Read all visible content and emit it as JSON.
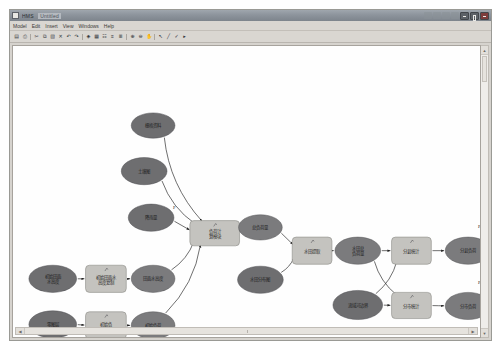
{
  "window": {
    "title": "HMS",
    "title_secondary": "Untitled",
    "controls": [
      "minimize",
      "maximize",
      "close"
    ]
  },
  "menubar": {
    "items": [
      {
        "label": "Model"
      },
      {
        "label": "Edit"
      },
      {
        "label": "Insert"
      },
      {
        "label": "View"
      },
      {
        "label": "Windows"
      },
      {
        "label": "Help"
      }
    ]
  },
  "toolbar": {
    "buttons": [
      {
        "name": "save-icon",
        "glyph": "▤"
      },
      {
        "name": "print-icon",
        "glyph": "⎙"
      },
      {
        "name": "cut-icon",
        "glyph": "✂"
      },
      {
        "name": "copy-icon",
        "glyph": "⧉"
      },
      {
        "name": "paste-icon",
        "glyph": "▧"
      },
      {
        "name": "delete-icon",
        "glyph": "✕"
      },
      {
        "name": "undo-icon",
        "glyph": "↶"
      },
      {
        "name": "redo-icon",
        "glyph": "↷"
      },
      {
        "name": "run-icon",
        "glyph": "◈"
      },
      {
        "name": "grid-icon",
        "glyph": "▦"
      },
      {
        "name": "layers-icon",
        "glyph": "☷"
      },
      {
        "name": "align-left-icon",
        "glyph": "≡"
      },
      {
        "name": "align-right-icon",
        "glyph": "≣"
      },
      {
        "name": "zoom-in-icon",
        "glyph": "⊕"
      },
      {
        "name": "zoom-out-icon",
        "glyph": "⊖"
      },
      {
        "name": "pan-icon",
        "glyph": "✋"
      },
      {
        "name": "pointer-icon",
        "glyph": "↖"
      },
      {
        "name": "connector-icon",
        "glyph": "╱"
      },
      {
        "name": "link-icon",
        "glyph": "✓"
      },
      {
        "name": "more-icon",
        "glyph": "▸"
      }
    ]
  },
  "scrollbars": {
    "vertical_up": "▲",
    "vertical_down": "▼",
    "horizontal_left": "◀",
    "horizontal_right": "▶"
  },
  "diagram": {
    "nodes": [
      {
        "id": "n1",
        "label": "栅格资料",
        "shape": "ellipse",
        "tone": "dark",
        "cx": 141,
        "cy": 82,
        "rx": 22,
        "ry": 13
      },
      {
        "id": "n2",
        "label": "土壤图",
        "shape": "ellipse",
        "tone": "dark",
        "cx": 132,
        "cy": 129,
        "rx": 23,
        "ry": 14
      },
      {
        "id": "n3",
        "label": "降雨量",
        "shape": "ellipse",
        "tone": "dark",
        "cx": 139,
        "cy": 177,
        "rx": 23,
        "ry": 14
      },
      {
        "id": "n4",
        "label": "负荷计算模块",
        "shape": "process",
        "x": 178,
        "y": 180,
        "w": 50,
        "h": 26
      },
      {
        "id": "n5",
        "label": "总负荷量",
        "shape": "ellipse",
        "tone": "mid",
        "cx": 249,
        "cy": 187,
        "rx": 22,
        "ry": 13
      },
      {
        "id": "n6",
        "label": "水田分布图",
        "shape": "ellipse",
        "tone": "dark",
        "cx": 249,
        "cy": 241,
        "rx": 23,
        "ry": 14
      },
      {
        "id": "n7",
        "label": "初始田面水高度",
        "shape": "ellipse",
        "tone": "dark",
        "cx": 40,
        "cy": 240,
        "rx": 24,
        "ry": 14
      },
      {
        "id": "n8",
        "label": "初始田面水高度复制",
        "shape": "process",
        "x": 73,
        "y": 226,
        "w": 41,
        "h": 28
      },
      {
        "id": "n9",
        "label": "田面水高度",
        "shape": "ellipse",
        "tone": "mid",
        "cx": 141,
        "cy": 240,
        "rx": 22,
        "ry": 14
      },
      {
        "id": "n10",
        "label": "零图层",
        "shape": "ellipse",
        "tone": "dark",
        "cx": 40,
        "cy": 287,
        "rx": 24,
        "ry": 14
      },
      {
        "id": "n11",
        "label": "初始负荷复制",
        "shape": "process",
        "x": 73,
        "y": 274,
        "w": 41,
        "h": 28
      },
      {
        "id": "n12",
        "label": "初始负荷",
        "shape": "ellipse",
        "tone": "mid",
        "cx": 141,
        "cy": 288,
        "rx": 22,
        "ry": 14
      },
      {
        "id": "n13",
        "label": "水田提取",
        "shape": "process",
        "x": 281,
        "y": 197,
        "w": 40,
        "h": 28
      },
      {
        "id": "n14",
        "label": "水田总负荷量",
        "shape": "ellipse",
        "tone": "mid",
        "cx": 347,
        "cy": 211,
        "rx": 23,
        "ry": 14
      },
      {
        "id": "n15",
        "label": "分县统计",
        "shape": "process",
        "x": 381,
        "y": 197,
        "w": 40,
        "h": 28
      },
      {
        "id": "n16",
        "label": "分县负荷",
        "shape": "ellipse",
        "tone": "mid",
        "cx": 458,
        "cy": 211,
        "rx": 23,
        "ry": 14
      },
      {
        "id": "n17",
        "label": "流域河边界",
        "shape": "ellipse",
        "tone": "dark",
        "cx": 347,
        "cy": 267,
        "rx": 25,
        "ry": 15
      },
      {
        "id": "n18",
        "label": "分市统计",
        "shape": "process",
        "x": 381,
        "y": 254,
        "w": 40,
        "h": 27
      },
      {
        "id": "n19",
        "label": "分市负荷",
        "shape": "ellipse",
        "tone": "mid",
        "cx": 458,
        "cy": 268,
        "rx": 23,
        "ry": 14
      }
    ],
    "annotations": [
      {
        "label": "P",
        "x": 161,
        "y": 168
      },
      {
        "label": "P",
        "x": 468,
        "y": 188
      },
      {
        "label": "P",
        "x": 468,
        "y": 245
      }
    ],
    "edges": [
      {
        "from": "n1",
        "to": "n4"
      },
      {
        "from": "n2",
        "to": "n4"
      },
      {
        "from": "n3",
        "to": "n4"
      },
      {
        "from": "n9",
        "to": "n4"
      },
      {
        "from": "n12",
        "to": "n4"
      },
      {
        "from": "n4",
        "to": "n5"
      },
      {
        "from": "n7",
        "to": "n8"
      },
      {
        "from": "n8",
        "to": "n9"
      },
      {
        "from": "n10",
        "to": "n11"
      },
      {
        "from": "n11",
        "to": "n12"
      },
      {
        "from": "n5",
        "to": "n13"
      },
      {
        "from": "n6",
        "to": "n13"
      },
      {
        "from": "n13",
        "to": "n14"
      },
      {
        "from": "n14",
        "to": "n15"
      },
      {
        "from": "n14",
        "to": "n18"
      },
      {
        "from": "n17",
        "to": "n15"
      },
      {
        "from": "n17",
        "to": "n18"
      },
      {
        "from": "n15",
        "to": "n16"
      },
      {
        "from": "n18",
        "to": "n19"
      }
    ]
  },
  "colors": {
    "canvas": "#fefefe",
    "chrome": "#d6d3ce",
    "titlebar": "#8d949c",
    "ellipse_dark": "#6e6e70",
    "ellipse_mid": "#7b7b7d",
    "process_fill": "#c4c3bf",
    "edge": "#2c2c2c"
  }
}
